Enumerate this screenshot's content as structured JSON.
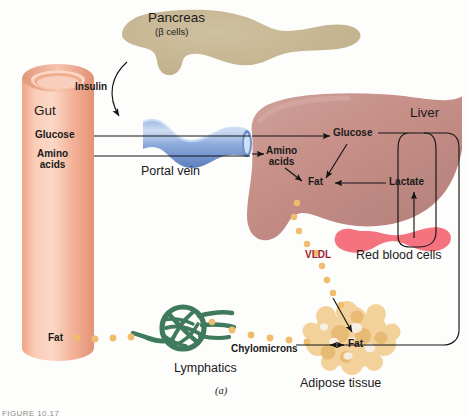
{
  "figure": {
    "panel_label": "(a)",
    "caption": "FIGURE 10.17",
    "organs": [
      {
        "name": "Gut",
        "label": "Gut",
        "color": "#f6b49a"
      },
      {
        "name": "Pancreas",
        "label": "Pancreas",
        "sublabel": "(β cells)",
        "color": "#c6b793"
      },
      {
        "name": "Portal vein",
        "label": "Portal vein",
        "color": "#8aa8da"
      },
      {
        "name": "Liver",
        "label": "Liver",
        "color": "#c5908b"
      },
      {
        "name": "Red blood cells",
        "label": "Red blood cells",
        "color": "#f4737f"
      },
      {
        "name": "Lymphatics",
        "label": "Lymphatics",
        "color": "#3e7a5b"
      },
      {
        "name": "Adipose tissue",
        "label": "Adipose tissue",
        "color": "#efc98c"
      }
    ],
    "metabolites": {
      "insulin": "Insulin",
      "glucose_gut": "Glucose",
      "amino_acids_gut_line1": "Amino",
      "amino_acids_gut_line2": "acids",
      "fat_gut": "Fat",
      "glucose_liver": "Glucose",
      "amino_acids_liver_line1": "Amino",
      "amino_acids_liver_line2": "acids",
      "fat_liver": "Fat",
      "lactate": "Lactate",
      "vldl": "VLDL",
      "chylomicrons": "Chylomicrons",
      "fat_adipose": "Fat"
    },
    "colors": {
      "vldl_text": "#a3202f",
      "chylomicron_dot": "#f0bc6e",
      "arrow": "#1b1b1b",
      "background": "#fdfdfc"
    }
  }
}
